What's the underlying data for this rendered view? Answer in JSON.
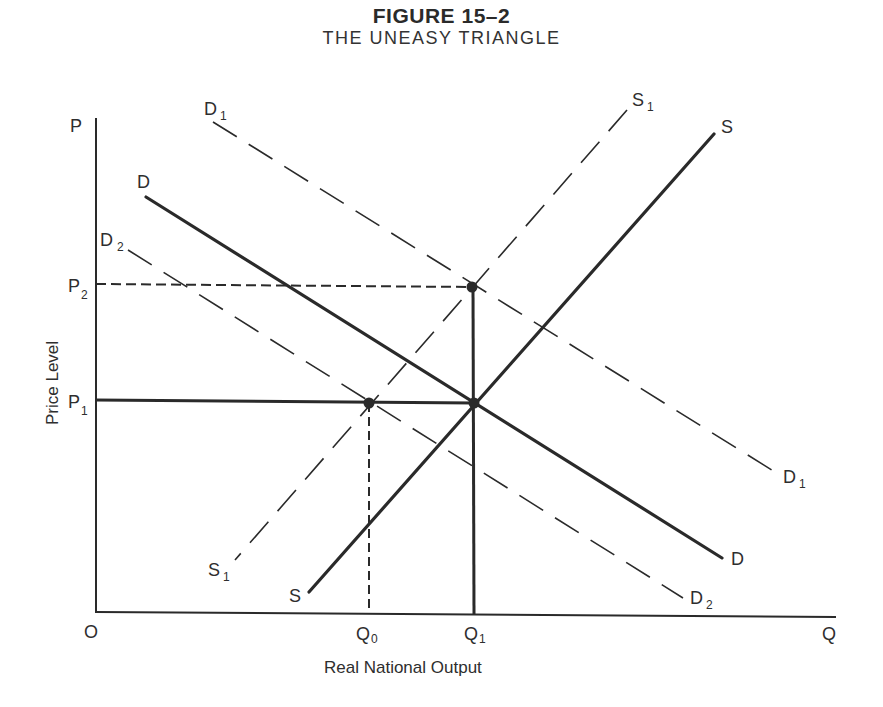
{
  "figure": {
    "number": "FIGURE 15–2",
    "title": "THE UNEASY TRIANGLE"
  },
  "axes": {
    "y_label": "Price Level",
    "x_label": "Real National Output",
    "y_axis_symbol": "P",
    "x_axis_symbol": "Q",
    "origin": "O",
    "y_ticks": [
      {
        "base": "P",
        "sub": "2"
      },
      {
        "base": "P",
        "sub": "1"
      }
    ],
    "x_ticks": [
      {
        "base": "Q",
        "sub": "0"
      },
      {
        "base": "Q",
        "sub": "1"
      }
    ]
  },
  "curves": {
    "D": {
      "start_label": "D",
      "end_label": "D",
      "style": "solid-thick"
    },
    "S": {
      "start_label": "S",
      "end_label": "S",
      "style": "solid-thick"
    },
    "D1": {
      "base": "D",
      "sub": "1",
      "style": "dashed"
    },
    "D2": {
      "base": "D",
      "sub": "2",
      "style": "dashed"
    },
    "S1": {
      "base": "S",
      "sub": "1",
      "style": "dashed"
    }
  },
  "points": [
    {
      "name": "P2-Q1",
      "label": "S1 ∩ D1"
    },
    {
      "name": "P1-Q1",
      "label": "S ∩ D"
    },
    {
      "name": "P1-Q0",
      "label": "S1 ∩ D2"
    }
  ],
  "colors": {
    "line": "#2a2a2a",
    "background": "#ffffff"
  }
}
